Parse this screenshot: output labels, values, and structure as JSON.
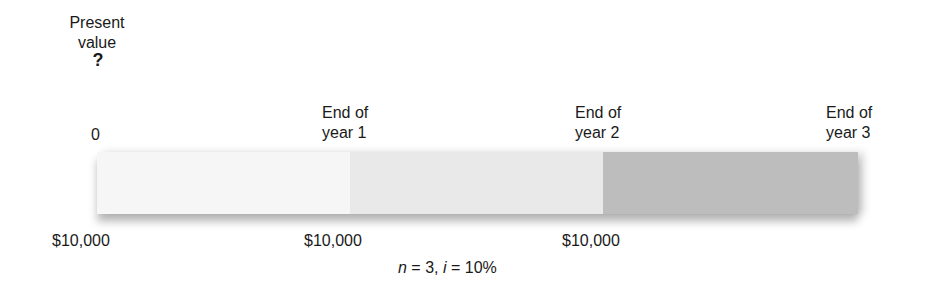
{
  "present_value": {
    "label_line1": "Present",
    "label_line2": "value",
    "unknown": "?"
  },
  "timeline": {
    "points": [
      {
        "label": "0"
      },
      {
        "line1": "End of",
        "line2": "year 1"
      },
      {
        "line1": "End of",
        "line2": "year 2"
      },
      {
        "line1": "End of",
        "line2": "year 3"
      }
    ],
    "segments": [
      {
        "color": "#f6f6f6"
      },
      {
        "color": "#e9e9e9"
      },
      {
        "color": "#bdbdbd"
      }
    ]
  },
  "cash_flows": [
    "$10,000",
    "$10,000",
    "$10,000"
  ],
  "parameters": {
    "n_symbol": "n",
    "n_value": " = 3, ",
    "i_symbol": "i",
    "i_value": " = 10%"
  }
}
